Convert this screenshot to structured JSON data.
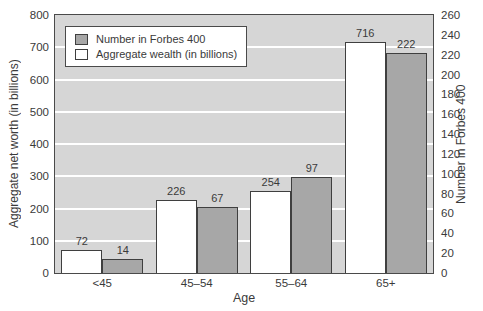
{
  "legend": {
    "items": [
      {
        "label": "Number in Forbes 400",
        "swatch_color": "#a7a7a7"
      },
      {
        "label": "Aggregate wealth (in billions)",
        "swatch_color": "#ffffff"
      }
    ]
  },
  "chart_data": {
    "type": "bar",
    "title": "",
    "categories": [
      "<45",
      "45–54",
      "55–64",
      "65+"
    ],
    "series": [
      {
        "name": "Aggregate wealth (in billions)",
        "axis": "left",
        "color": "#ffffff",
        "values": [
          72,
          226,
          254,
          716
        ]
      },
      {
        "name": "Number in Forbes 400",
        "axis": "right",
        "color": "#a7a7a7",
        "values": [
          14,
          67,
          97,
          222
        ]
      }
    ],
    "left_axis": {
      "label": "Aggregate net worth (in billions)",
      "min": 0,
      "max": 800,
      "step": 100
    },
    "right_axis": {
      "label": "Number in Forbes 400",
      "min": 0,
      "max": 260,
      "step": 20
    },
    "xlabel": "Age",
    "grid": "horizontal",
    "gridline_color": "#ffffff",
    "plot_background": "#d6d6d6",
    "bar_border_color": "#3f3f3f",
    "legend_position": "upper-left"
  }
}
